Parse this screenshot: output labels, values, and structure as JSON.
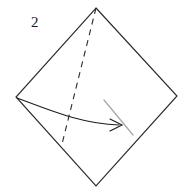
{
  "figure": {
    "type": "origami-fold-diagram",
    "step_label": "2",
    "background_color": "#ffffff",
    "line_color": "#2b2b2b",
    "dashed_line_color": "#2b2b2b",
    "guide_line_color": "#a8a8a8",
    "arrow_color": "#1f1f1f",
    "shape": {
      "name": "square-rotated-45",
      "vertices": {
        "top": [
          96,
          8
        ],
        "right": [
          177,
          96
        ],
        "bottom": [
          96,
          186
        ],
        "left": [
          16,
          97
        ]
      },
      "path": "M 96 8 L 177 96 L 96 186 L 16 97 Z"
    },
    "crease": {
      "name": "valley-fold-crease",
      "style": "dashed",
      "from": [
        96,
        8
      ],
      "to": [
        62,
        144
      ],
      "dash_pattern": "6 5"
    },
    "fold_arrow": {
      "name": "fold-direction-arrow",
      "style": "curved",
      "path": "M 17 98 C 45 108, 80 124, 119 125",
      "head": {
        "tip": [
          122,
          125
        ],
        "upper": [
          110,
          119
        ],
        "lower": [
          110,
          131
        ]
      }
    },
    "guide_line": {
      "name": "alignment-guide-line",
      "from": [
        104,
        100
      ],
      "to": [
        133,
        135
      ]
    }
  }
}
